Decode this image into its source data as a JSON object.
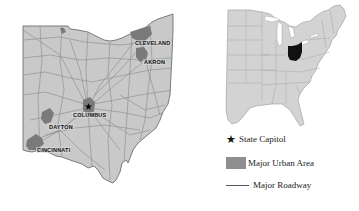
{
  "ohio_map": {
    "cities": [
      {
        "name": "CLEVELAND",
        "x": 134,
        "y": 40
      },
      {
        "name": "AKRON",
        "x": 143,
        "y": 59
      },
      {
        "name": "COLUMBUS",
        "x": 72,
        "y": 113
      },
      {
        "name": "DAYTON",
        "x": 48,
        "y": 124
      },
      {
        "name": "CINCINNATI",
        "x": 36,
        "y": 147
      }
    ],
    "capital": "COLUMBUS"
  },
  "us_locator_map": {
    "highlighted_state": "Ohio",
    "highlight_color": "#111111"
  },
  "legend": {
    "items": [
      {
        "symbol": "star",
        "label": "State Capitol"
      },
      {
        "symbol": "urban-swatch",
        "label": "Major Urban Area",
        "color": "#8e8e8e"
      },
      {
        "symbol": "line",
        "label": "Major Roadway",
        "color": "#555555"
      }
    ]
  },
  "colors": {
    "state_fill": "#c9c9c9",
    "state_border": "#777777",
    "road": "#8a8a8a",
    "urban": "#7a7a7a",
    "background": "#ffffff"
  }
}
